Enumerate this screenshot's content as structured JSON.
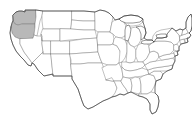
{
  "figure": {
    "title": "Map of the contiguous United States",
    "width_px": 192,
    "height_px": 119,
    "background_color": "#ffffff",
    "state_border_color": "#777777",
    "national_border_color": "#3a3a3a",
    "highlight_color": "#b8b8b8",
    "lake_outline_color": "#444444"
  },
  "map": {
    "region_name": "Contiguous United States",
    "projection_note": "Albers-like",
    "highlighted_regions": [
      "Washington",
      "Oregon",
      "California coast"
    ],
    "states": [
      {
        "name": "Washington",
        "abbr": "WA",
        "highlighted": true
      },
      {
        "name": "Oregon",
        "abbr": "OR",
        "highlighted": true
      },
      {
        "name": "California",
        "abbr": "CA",
        "highlighted": false
      },
      {
        "name": "Idaho",
        "abbr": "ID",
        "highlighted": false
      },
      {
        "name": "Nevada",
        "abbr": "NV",
        "highlighted": false
      },
      {
        "name": "Montana",
        "abbr": "MT",
        "highlighted": false
      },
      {
        "name": "Wyoming",
        "abbr": "WY",
        "highlighted": false
      },
      {
        "name": "Utah",
        "abbr": "UT",
        "highlighted": false
      },
      {
        "name": "Arizona",
        "abbr": "AZ",
        "highlighted": false
      },
      {
        "name": "Colorado",
        "abbr": "CO",
        "highlighted": false
      },
      {
        "name": "New Mexico",
        "abbr": "NM",
        "highlighted": false
      },
      {
        "name": "North Dakota",
        "abbr": "ND",
        "highlighted": false
      },
      {
        "name": "South Dakota",
        "abbr": "SD",
        "highlighted": false
      },
      {
        "name": "Nebraska",
        "abbr": "NE",
        "highlighted": false
      },
      {
        "name": "Kansas",
        "abbr": "KS",
        "highlighted": false
      },
      {
        "name": "Oklahoma",
        "abbr": "OK",
        "highlighted": false
      },
      {
        "name": "Texas",
        "abbr": "TX",
        "highlighted": false
      },
      {
        "name": "Minnesota",
        "abbr": "MN",
        "highlighted": false
      },
      {
        "name": "Iowa",
        "abbr": "IA",
        "highlighted": false
      },
      {
        "name": "Missouri",
        "abbr": "MO",
        "highlighted": false
      },
      {
        "name": "Arkansas",
        "abbr": "AR",
        "highlighted": false
      },
      {
        "name": "Louisiana",
        "abbr": "LA",
        "highlighted": false
      },
      {
        "name": "Wisconsin",
        "abbr": "WI",
        "highlighted": false
      },
      {
        "name": "Illinois",
        "abbr": "IL",
        "highlighted": false
      },
      {
        "name": "Michigan",
        "abbr": "MI",
        "highlighted": false
      },
      {
        "name": "Indiana",
        "abbr": "IN",
        "highlighted": false
      },
      {
        "name": "Ohio",
        "abbr": "OH",
        "highlighted": false
      },
      {
        "name": "Kentucky",
        "abbr": "KY",
        "highlighted": false
      },
      {
        "name": "Tennessee",
        "abbr": "TN",
        "highlighted": false
      },
      {
        "name": "Mississippi",
        "abbr": "MS",
        "highlighted": false
      },
      {
        "name": "Alabama",
        "abbr": "AL",
        "highlighted": false
      },
      {
        "name": "Georgia",
        "abbr": "GA",
        "highlighted": false
      },
      {
        "name": "Florida",
        "abbr": "FL",
        "highlighted": false
      },
      {
        "name": "South Carolina",
        "abbr": "SC",
        "highlighted": false
      },
      {
        "name": "North Carolina",
        "abbr": "NC",
        "highlighted": false
      },
      {
        "name": "Virginia",
        "abbr": "VA",
        "highlighted": false
      },
      {
        "name": "West Virginia",
        "abbr": "WV",
        "highlighted": false
      },
      {
        "name": "Maryland",
        "abbr": "MD",
        "highlighted": false
      },
      {
        "name": "Delaware",
        "abbr": "DE",
        "highlighted": false
      },
      {
        "name": "Pennsylvania",
        "abbr": "PA",
        "highlighted": false
      },
      {
        "name": "New Jersey",
        "abbr": "NJ",
        "highlighted": false
      },
      {
        "name": "New York",
        "abbr": "NY",
        "highlighted": false
      },
      {
        "name": "Connecticut",
        "abbr": "CT",
        "highlighted": false
      },
      {
        "name": "Rhode Island",
        "abbr": "RI",
        "highlighted": false
      },
      {
        "name": "Massachusetts",
        "abbr": "MA",
        "highlighted": false
      },
      {
        "name": "Vermont",
        "abbr": "VT",
        "highlighted": false
      },
      {
        "name": "New Hampshire",
        "abbr": "NH",
        "highlighted": false
      },
      {
        "name": "Maine",
        "abbr": "ME",
        "highlighted": false
      }
    ],
    "lakes": [
      "Lake Superior",
      "Lake Michigan",
      "Lake Huron",
      "Lake Erie",
      "Lake Ontario"
    ]
  }
}
